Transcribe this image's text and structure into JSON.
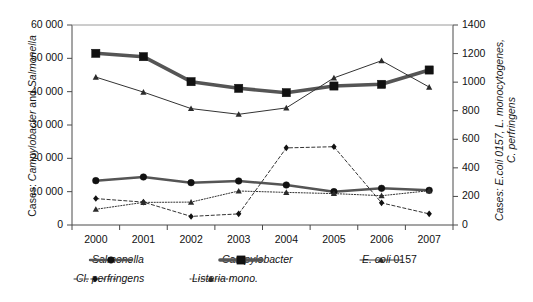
{
  "chart_data": {
    "type": "line",
    "title": "",
    "xlabel": "",
    "categories": [
      "2000",
      "2001",
      "2002",
      "2003",
      "2004",
      "2005",
      "2006",
      "2007"
    ],
    "axes": {
      "left": {
        "label_prefix": "Cases: ",
        "label_italic_1": "Campylobacter",
        "label_mid": " and ",
        "label_italic_2": "Salmonella",
        "label_full": "Cases: Campylobacter and Salmonella",
        "min": 0,
        "max": 60000,
        "step": 10000,
        "ticks": [
          "0",
          "10 000",
          "20 000",
          "30 000",
          "40 000",
          "50 000",
          "60 000"
        ]
      },
      "right": {
        "label_full": "Cases: E.coli 0157, L. monocytogenes, C. perfringens",
        "line1": "Cases: E.coli 0157, L. monocytogenes,",
        "line2": "C. perfringens",
        "min": 0,
        "max": 1400,
        "step": 200,
        "ticks": [
          "0",
          "200",
          "400",
          "600",
          "800",
          "1000",
          "1200",
          "1400"
        ]
      }
    },
    "grid": false,
    "legend_position": "bottom",
    "series": [
      {
        "name": "Salmonella",
        "axis": "left",
        "marker": "circle",
        "line_style": "solid",
        "line_weight": "medium",
        "color": "#555555",
        "values": [
          13300,
          14400,
          12700,
          13200,
          12000,
          10000,
          11000,
          10400
        ]
      },
      {
        "name": "Campylobacter",
        "axis": "left",
        "marker": "square",
        "line_style": "solid",
        "line_weight": "thick",
        "color": "#555555",
        "values": [
          51500,
          50500,
          43000,
          41000,
          39700,
          41700,
          42200,
          46500
        ]
      },
      {
        "name": "E. coli 0157",
        "axis": "right",
        "marker": "triangle",
        "line_style": "solid",
        "line_weight": "thin",
        "color": "#333333",
        "values": [
          1035,
          930,
          815,
          775,
          820,
          1030,
          1150,
          965
        ]
      },
      {
        "name": "Cl. perfringens",
        "axis": "right",
        "marker": "diamond",
        "line_style": "dashed",
        "line_weight": "thin",
        "color": "#333333",
        "values": [
          185,
          160,
          60,
          78,
          540,
          548,
          155,
          78
        ]
      },
      {
        "name": "Listeria mono.",
        "axis": "right",
        "marker": "triangle",
        "line_style": "dotted",
        "line_weight": "thin",
        "color": "#333333",
        "values": [
          110,
          158,
          160,
          238,
          228,
          220,
          205,
          240
        ]
      }
    ]
  },
  "legend": {
    "items": [
      {
        "label": "Salmonella",
        "italic": true,
        "marker": "circle",
        "style": "solid",
        "weight": "medium"
      },
      {
        "label": "Campylobacter",
        "italic": true,
        "marker": "square",
        "style": "solid",
        "weight": "thick"
      },
      {
        "label_italic": "E. coli",
        "label_rest": " 0157",
        "marker": "triangle",
        "style": "solid",
        "weight": "thin"
      },
      {
        "label": "Cl. perfringens",
        "italic": true,
        "marker": "diamond",
        "style": "dashed",
        "weight": "thin"
      },
      {
        "label": "Listeria mono.",
        "italic": true,
        "marker": "triangle",
        "style": "dotted",
        "weight": "thin"
      }
    ]
  }
}
